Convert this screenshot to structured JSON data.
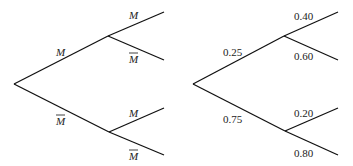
{
  "left_tree": {
    "first_branch": {
      "upper": "M",
      "lower": "M"
    },
    "second_branch_upper": {
      "upper": "M",
      "lower": "M"
    },
    "second_branch_lower": {
      "upper": "M",
      "lower": "M"
    },
    "complement_marker": "overline"
  },
  "right_tree": {
    "first_branch": {
      "upper": "0.25",
      "lower": "0.75"
    },
    "second_branch_upper": {
      "upper": "0.40",
      "lower": "0.60"
    },
    "second_branch_lower": {
      "upper": "0.20",
      "lower": "0.80"
    }
  }
}
